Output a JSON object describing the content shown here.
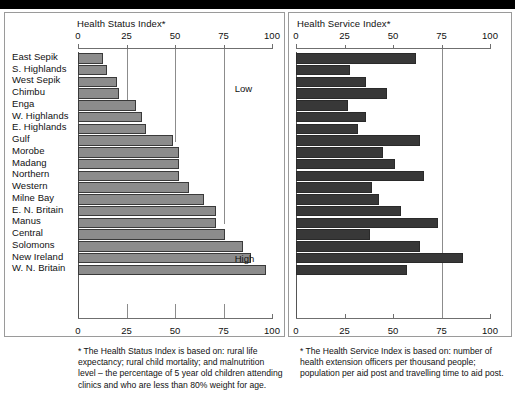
{
  "figure": {
    "background_color": "#ffffff",
    "top_bar_color": "#000000",
    "frame_color": "#9a9a9a"
  },
  "chart_data": [
    {
      "id": "health-status-index",
      "type": "bar",
      "orientation": "horizontal",
      "title": "Health Status Index*",
      "xlabel": "",
      "ylabel": "",
      "xlim": [
        0,
        100
      ],
      "ticks": [
        0,
        25,
        50,
        75,
        100
      ],
      "tick_labels": [
        "0",
        "25",
        "50",
        "75",
        "100"
      ],
      "grid": "vertical gridlines at 25, 50, 75",
      "bar_color": "#8c8c8c",
      "bar_edge_color": "#3a3a3a",
      "annotations": [
        {
          "text": "Low",
          "near_value": 88,
          "position": "upper right"
        },
        {
          "text": "High",
          "near_value": 88,
          "position": "lower right"
        }
      ],
      "categories": [
        "East Sepik",
        "S. Highlands",
        "West Sepik",
        "Chimbu",
        "Enga",
        "W. Highlands",
        "E. Highlands",
        "Gulf",
        "Morobe",
        "Madang",
        "Northern",
        "Western",
        "Milne Bay",
        "E. N. Britain",
        "Manus",
        "Central",
        "Solomons",
        "New Ireland",
        "W. N. Britain"
      ],
      "values": [
        13,
        15,
        20,
        21,
        30,
        33,
        35,
        49,
        52,
        52,
        52,
        57,
        65,
        71,
        71,
        76,
        85,
        89,
        97
      ]
    },
    {
      "id": "health-service-index",
      "type": "bar",
      "orientation": "horizontal",
      "title": "Health Service Index*",
      "xlabel": "",
      "ylabel": "",
      "xlim": [
        0,
        100
      ],
      "ticks": [
        0,
        25,
        50,
        75,
        100
      ],
      "tick_labels": [
        "0",
        "25",
        "50",
        "75",
        "100"
      ],
      "grid": "vertical gridline at 75",
      "bar_color": "#383838",
      "bar_edge_color": "#2a2a2a",
      "annotations": [],
      "categories": [
        "East Sepik",
        "S. Highlands",
        "West Sepik",
        "Chimbu",
        "Enga",
        "W. Highlands",
        "E. Highlands",
        "Gulf",
        "Morobe",
        "Madang",
        "Northern",
        "Western",
        "Milne Bay",
        "E. N. Britain",
        "Manus",
        "Central",
        "Solomons",
        "New Ireland",
        "W. N. Britain"
      ],
      "values": [
        62,
        28,
        36,
        47,
        27,
        36,
        32,
        64,
        45,
        51,
        66,
        39,
        43,
        54,
        73,
        38,
        64,
        86,
        57
      ]
    }
  ],
  "footnotes": {
    "left": "* The Health Status Index is based on: rural life expectancy; rural child mortality; and malnutrition level – the percentage of 5 year old children attending clinics and who are less than 80% weight for age.",
    "right": "* The Health Service Index is based on: number of health extension officers per thousand people; population per aid post and travelling time to aid post."
  }
}
